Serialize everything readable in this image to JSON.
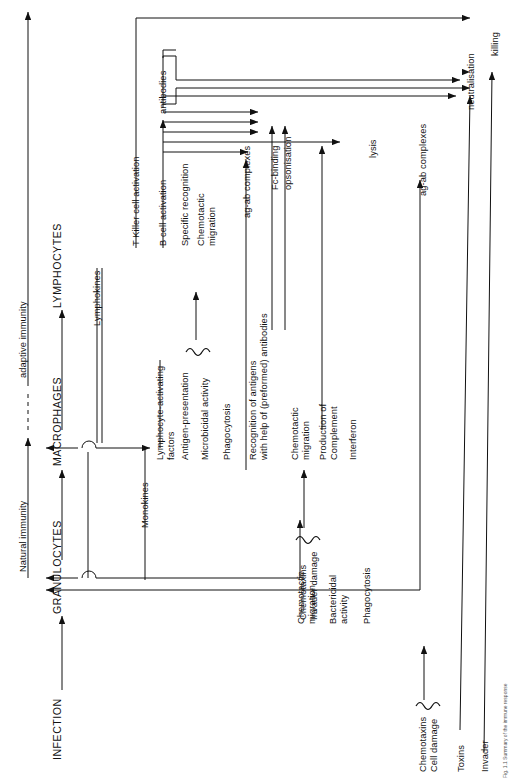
{
  "figure": {
    "orientation": "rotated-90-ccw",
    "page_number": "3",
    "caption": "Fig. 1.1 Summary of the immune response"
  },
  "axes": {
    "natural_immunity": "Natural immunity",
    "adaptive_immunity": "adaptive immunity"
  },
  "cell_types": {
    "infection": "INFECTION",
    "granulocytes": "GRANULOCYTES",
    "macrophages": "MACROPHAGES",
    "lymphocytes": "LYMPHOCYTES"
  },
  "mediators": {
    "monokines": "Monokines",
    "lymphokines": "Lymphokines",
    "antibodies": "antibodies"
  },
  "granulocyte_functions": [
    "Chemotactic",
    "migration",
    "Bactericidal",
    "activity",
    "Phagocytosis"
  ],
  "granulocyte_function_blocks": {
    "chemotactic_migration": "Chemotactic\nmigration",
    "bactericidal_activity": "Bactericidal\nactivity",
    "phagocytosis": "Phagocytosis"
  },
  "macrophage_functions": {
    "lymphocyte_activating_factors": "Lymphocyte-activating\nfactors",
    "antigen_presentation": "Antigen-presentation",
    "microbicidal_activity": "Microbicidal activity",
    "phagocytosis": "Phagocytosis",
    "recognition_of_antigens": "Recognition of antigens\nwith help of (preformed) antibodies",
    "chemotactic_migration": "Chemotactic\nmigration",
    "production_of_complement": "Production of\nComplement",
    "interferon": "Interferon"
  },
  "lymphocyte_functions": {
    "t_killer_cell_activation": "T Killer cell activation",
    "b_cell_activation": "B cell activation",
    "specific_recognition": "Specific recognition",
    "chemotactic_migration": "Chemotactic\nmigration"
  },
  "stimuli": {
    "chemotaxins_invader_damage": "Chemotaxins\nInvader damage",
    "chemotaxins_cell_damage": "Chemotaxins\nCell damage",
    "toxins": "Toxins",
    "invader": "Invader"
  },
  "outcomes": {
    "ag_ab_complexes_mid": "ag-ab complexes",
    "fc_binding": "Fc-binding",
    "opsonisation": "opsonisation",
    "lysis": "lysis",
    "ag_ab_complexes_right": "ag-ab complexes",
    "neutralisation": "neutralisation",
    "killing": "killing"
  },
  "colors": {
    "ink": "#111111",
    "background": "#ffffff"
  }
}
